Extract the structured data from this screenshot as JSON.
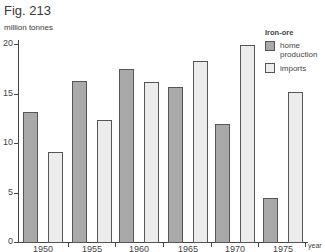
{
  "figure": {
    "title": "Fig. 213",
    "y_unit": "million tonnes",
    "x_unit": "year"
  },
  "legend": {
    "title": "Iron-ore",
    "items": [
      {
        "label": "home production",
        "color": "#a9a9a9"
      },
      {
        "label": "imports",
        "color": "#ececec"
      }
    ]
  },
  "axis": {
    "y_ticks": [
      "0",
      "5",
      "10",
      "15",
      "20"
    ],
    "x_ticks": [
      "1950",
      "1955",
      "1960",
      "1965",
      "1970",
      "1975"
    ]
  },
  "chart_data": {
    "type": "bar",
    "title": "Fig. 213",
    "xlabel": "year",
    "ylabel": "million tonnes",
    "ylim": [
      0,
      20
    ],
    "grid": false,
    "legend_position": "top-right",
    "legend_title": "Iron-ore",
    "categories": [
      "1950",
      "1955",
      "1960",
      "1965",
      "1970",
      "1975"
    ],
    "series": [
      {
        "name": "home production",
        "color": "#a9a9a9",
        "values": [
          13.1,
          16.3,
          17.5,
          15.7,
          11.9,
          4.4
        ]
      },
      {
        "name": "imports",
        "color": "#ececec",
        "values": [
          9.1,
          12.3,
          16.2,
          18.3,
          19.9,
          15.2
        ]
      }
    ]
  }
}
